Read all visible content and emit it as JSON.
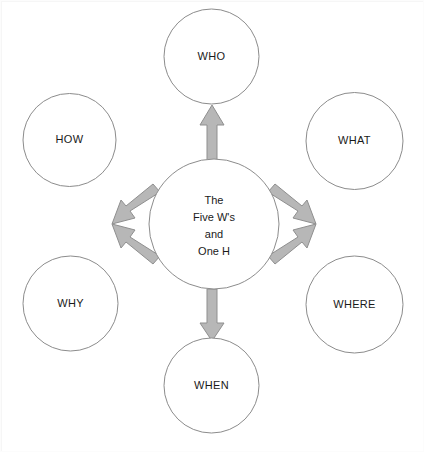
{
  "diagram": {
    "title": "The Five W's and One H",
    "type": "radial-hub-and-spoke",
    "canvas": {
      "width": 424,
      "height": 452,
      "background": "#ffffff"
    },
    "colors": {
      "circle_fill": "#ffffff",
      "circle_stroke": "#8c8c8c",
      "arrow_fill": "#b7b7b7",
      "arrow_stroke": "#8f8f8f",
      "text": "#1a1a1a"
    },
    "center": {
      "id": "center-hub",
      "lines": [
        "The",
        "Five W's",
        "and",
        "One H"
      ],
      "cx": 213,
      "cy": 223,
      "r": 65
    },
    "nodes": [
      {
        "id": "who",
        "label": "WHO",
        "cx": 210.5,
        "cy": 55.5,
        "r": 47.5,
        "direction": "up"
      },
      {
        "id": "what",
        "label": "WHAT",
        "cx": 353.5,
        "cy": 140.0,
        "r": 48.5,
        "direction": "upper-right"
      },
      {
        "id": "where",
        "label": "WHERE",
        "cx": 353.5,
        "cy": 303.5,
        "r": 48.5,
        "direction": "lower-right"
      },
      {
        "id": "when",
        "label": "WHEN",
        "cx": 210.5,
        "cy": 384.5,
        "r": 47.5,
        "direction": "down"
      },
      {
        "id": "why",
        "label": "WHY",
        "cx": 69.5,
        "cy": 302.5,
        "r": 47.5,
        "direction": "lower-left"
      },
      {
        "id": "how",
        "label": "HOW",
        "cx": 68.5,
        "cy": 139.0,
        "r": 46.5,
        "direction": "upper-left"
      }
    ],
    "arrows": [
      {
        "id": "arrow-to-who",
        "from": "center-hub",
        "to": "who",
        "direction": "up"
      },
      {
        "id": "arrow-to-what",
        "from": "center-hub",
        "to": "what",
        "direction": "upper-right"
      },
      {
        "id": "arrow-to-where",
        "from": "center-hub",
        "to": "where",
        "direction": "lower-right"
      },
      {
        "id": "arrow-to-when",
        "from": "center-hub",
        "to": "when",
        "direction": "down"
      },
      {
        "id": "arrow-to-why",
        "from": "center-hub",
        "to": "why",
        "direction": "lower-left"
      },
      {
        "id": "arrow-to-how",
        "from": "center-hub",
        "to": "how",
        "direction": "upper-left"
      }
    ]
  }
}
